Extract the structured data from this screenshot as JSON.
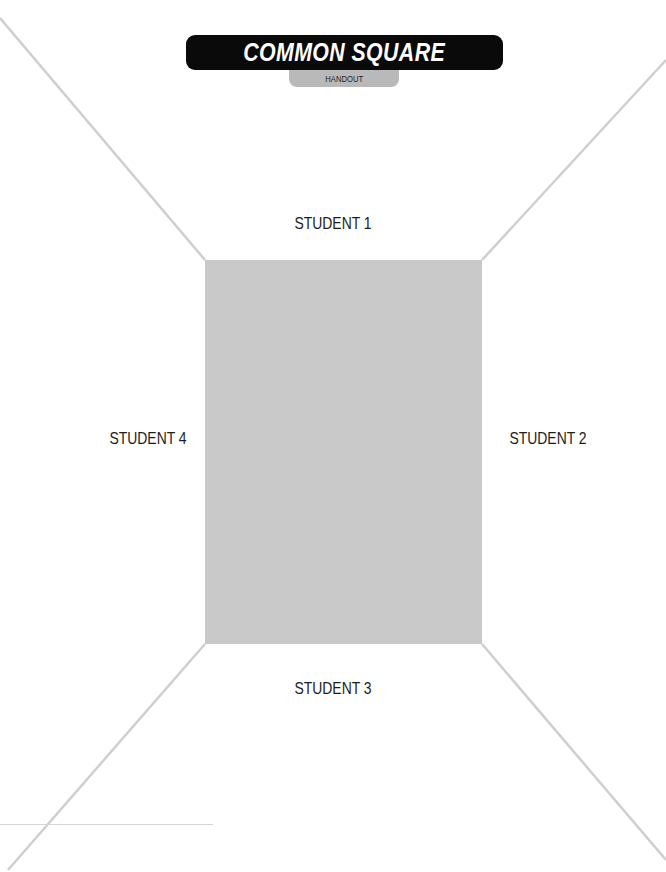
{
  "header": {
    "title": "COMMON SQUARE",
    "subtitle": "HANDOUT"
  },
  "colors": {
    "title_bar": "#0a0a0a",
    "handout_tab": "#b9b9b9",
    "center_box": "#c9c9c9",
    "diagonal_lines": "#cfcfcf"
  },
  "sections": {
    "top": "STUDENT 1",
    "right": "STUDENT 2",
    "bottom": "STUDENT 3",
    "left": "STUDENT 4"
  },
  "center_area": {
    "label": ""
  }
}
